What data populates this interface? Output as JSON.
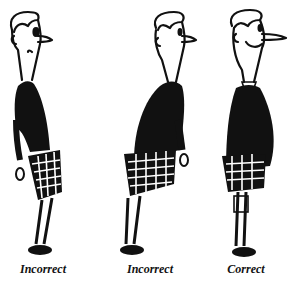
{
  "illustration": {
    "description": "Three cartoon figures in kilts demonstrating standing posture",
    "ink_color": "#111111",
    "background": "#ffffff",
    "figures": [
      {
        "id": "figure-1",
        "caption": "Incorrect",
        "posture": "pelvis pushed forward, shoulders back"
      },
      {
        "id": "figure-2",
        "caption": "Incorrect",
        "posture": "hips back, upper body leaning forward"
      },
      {
        "id": "figure-3",
        "caption": "Correct",
        "posture": "upright, smiling, belly out"
      }
    ]
  }
}
